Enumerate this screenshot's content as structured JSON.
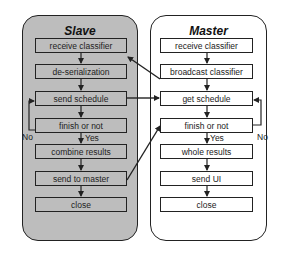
{
  "slave": {
    "title": "Slave",
    "steps": [
      "receive classifier",
      "de-serialization",
      "send schedule",
      "finish or not",
      "combine results",
      "send to master",
      "close"
    ],
    "loop_no_label": "No",
    "loop_yes_label": "Yes"
  },
  "master": {
    "title": "Master",
    "steps": [
      "receive classifier",
      "broadcast classifier",
      "get schedule",
      "finish or not",
      "whole results",
      "send UI",
      "close"
    ],
    "loop_no_label": "No",
    "loop_yes_label": "Yes"
  },
  "connections": [
    {
      "from": "master.broadcast classifier",
      "to": "slave.receive classifier"
    },
    {
      "from": "slave.send schedule",
      "to": "master.get schedule"
    },
    {
      "from": "slave.send to master",
      "to": "master.finish or not"
    }
  ],
  "colors": {
    "slave_fill": "#bdbdbd",
    "master_fill": "#ffffff",
    "stroke": "#222222"
  }
}
